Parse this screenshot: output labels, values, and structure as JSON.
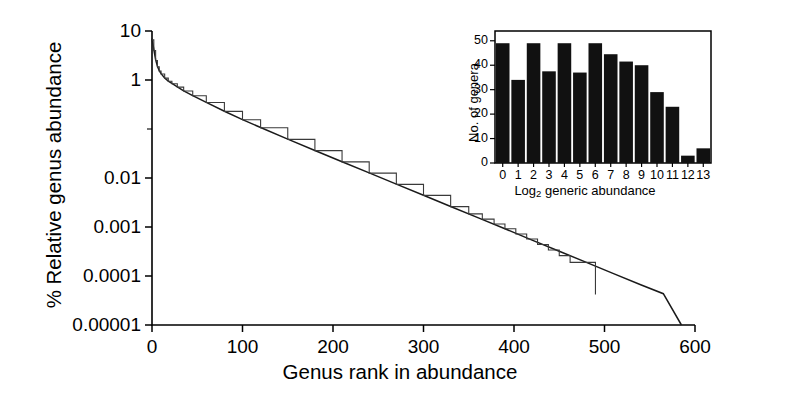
{
  "chart_data": {
    "type": "line",
    "title": "",
    "xlabel": "Genus rank in abundance",
    "ylabel": "% Relative genus abundance",
    "yscale": "log",
    "xlim": [
      0,
      600
    ],
    "ylim": [
      1e-05,
      10
    ],
    "grid": false,
    "legend": "none",
    "xticks": [
      0,
      100,
      200,
      300,
      400,
      500,
      600
    ],
    "xtick_labels": [
      "0",
      "100",
      "200",
      "300",
      "400",
      "500",
      "600"
    ],
    "yticks": [
      10,
      1,
      0.01,
      0.001,
      0.0001,
      1e-05
    ],
    "ytick_labels": [
      "10",
      "1",
      "0.01",
      "0.001",
      "0.0001",
      "0.00001"
    ],
    "series": [
      {
        "name": "fitted log-series curve",
        "style": "smooth-line",
        "x": [
          0,
          2,
          4,
          6,
          8,
          10,
          14,
          18,
          22,
          28,
          35,
          45,
          60,
          80,
          100,
          120,
          150,
          180,
          210,
          240,
          270,
          300,
          330,
          360,
          390,
          420,
          450,
          480,
          510,
          540,
          565,
          585
        ],
        "y": [
          7.0,
          4.2,
          2.6,
          1.9,
          1.55,
          1.35,
          1.1,
          0.95,
          0.85,
          0.72,
          0.6,
          0.48,
          0.35,
          0.23,
          0.155,
          0.107,
          0.062,
          0.0365,
          0.0215,
          0.0127,
          0.0075,
          0.00445,
          0.00262,
          0.00155,
          0.00092,
          0.00054,
          0.00032,
          0.00019,
          0.000112,
          6.65e-05,
          4.35e-05,
          1e-05
        ]
      },
      {
        "name": "observed rank abundance",
        "style": "stepped-line",
        "x": [
          0,
          2,
          4,
          6,
          8,
          10,
          14,
          18,
          22,
          28,
          35,
          45,
          60,
          80,
          100,
          120,
          150,
          180,
          210,
          240,
          270,
          300,
          330,
          350,
          365,
          378,
          390,
          402,
          414,
          426,
          438,
          450,
          462,
          490
        ],
        "y": [
          6.6,
          4.0,
          2.5,
          1.85,
          1.52,
          1.33,
          1.09,
          0.94,
          0.84,
          0.715,
          0.595,
          0.477,
          0.348,
          0.229,
          0.154,
          0.106,
          0.0615,
          0.0362,
          0.0213,
          0.0126,
          0.0074,
          0.00442,
          0.0026,
          0.00185,
          0.00145,
          0.00115,
          0.00092,
          0.00072,
          0.00057,
          0.00044,
          0.00034,
          0.00026,
          0.00019,
          4.2e-05
        ]
      }
    ],
    "inset": {
      "type": "bar",
      "title": "",
      "xlabel": "Log₂ generic abundance",
      "xlabel_base": "Log",
      "xlabel_sub": "2",
      "xlabel_rest": " generic abundance",
      "ylabel": "No. of genera",
      "categories": [
        "0",
        "1",
        "2",
        "3",
        "4",
        "5",
        "6",
        "7",
        "8",
        "9",
        "10",
        "11",
        "12",
        "13"
      ],
      "values": [
        49,
        34,
        49,
        37.5,
        49,
        37,
        49,
        44.5,
        41.5,
        40,
        29,
        23,
        3,
        6
      ],
      "yticks": [
        0,
        10,
        20,
        30,
        40,
        50
      ],
      "ytick_labels": [
        "0",
        "10",
        "20",
        "30",
        "40",
        "50"
      ],
      "ylim": [
        0,
        54
      ],
      "grid": false,
      "bar_color": "#111111"
    }
  },
  "colors": {
    "background": "#ffffff",
    "axis": "#000000",
    "fitted_line": "#1a1a1a",
    "observed_line": "#3a3a3a",
    "inset_bar": "#111111"
  }
}
